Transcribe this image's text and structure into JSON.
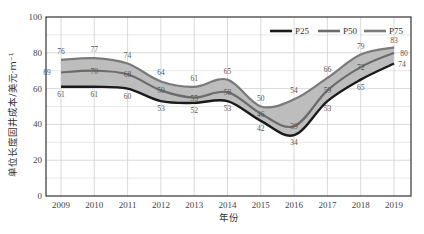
{
  "chart_data": {
    "type": "area",
    "title": "",
    "xlabel": "年份",
    "ylabel": "单位长度固井成本/美元·m⁻¹",
    "categories": [
      "2009",
      "2010",
      "2011",
      "2012",
      "2013",
      "2014",
      "2015",
      "2016",
      "2017",
      "2018",
      "2019"
    ],
    "series": [
      {
        "name": "P25",
        "values": [
          61,
          61,
          60,
          53,
          52,
          53,
          42,
          34,
          53,
          65,
          74
        ],
        "color": "#1a1a1a"
      },
      {
        "name": "P50",
        "values": [
          69,
          70,
          68,
          59,
          55,
          58,
          46,
          39,
          59,
          72,
          80
        ],
        "color": "#6b6b6b"
      },
      {
        "name": "P75",
        "values": [
          76,
          77,
          74,
          64,
          61,
          65,
          50,
          54,
          66,
          79,
          83
        ],
        "color": "#7a7a7a"
      }
    ],
    "band_fill": "#bdbdbd",
    "ylim": [
      0,
      100
    ],
    "yticks": [
      0,
      20,
      40,
      60,
      80,
      100
    ],
    "grid": true,
    "legend_position": "top-right"
  }
}
